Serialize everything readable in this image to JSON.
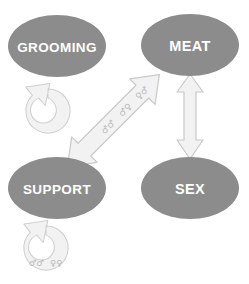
{
  "figure": {
    "background_color": "#ffffff",
    "node_fill": "#8c8c8c",
    "node_text_color": "#ffffff",
    "arrow_fill": "#f0f0f0",
    "arrow_stroke": "#c9c9c9",
    "symbol_color": "#b9b9b9"
  },
  "nodes": [
    {
      "id": "grooming",
      "label": "GROOMING",
      "cx": 57,
      "cy": 46,
      "rx": 49,
      "ry": 31
    },
    {
      "id": "meat",
      "label": "MEAT",
      "cx": 190,
      "cy": 45,
      "rx": 49,
      "ry": 31
    },
    {
      "id": "support",
      "label": "SUPPORT",
      "cx": 57,
      "cy": 188,
      "rx": 49,
      "ry": 31
    },
    {
      "id": "sex",
      "label": "SEX",
      "cx": 190,
      "cy": 188,
      "rx": 49,
      "ry": 31
    }
  ],
  "edges": [
    {
      "id": "grooming-self-loop",
      "type": "self-loop",
      "from": "grooming",
      "to": "grooming",
      "labels": []
    },
    {
      "id": "support-self-loop",
      "type": "self-loop",
      "from": "support",
      "to": "support",
      "labels": [
        "♂♂",
        "♀♀"
      ]
    },
    {
      "id": "grooming-meat-diagonal",
      "type": "double-headed-arrow",
      "from": "support",
      "to": "meat",
      "labels": [
        "♂♂",
        "♂♀",
        "♀♂"
      ]
    },
    {
      "id": "meat-sex-vertical",
      "type": "double-headed-arrow",
      "from": "meat",
      "to": "sex",
      "labels": []
    }
  ],
  "symbols": {
    "male": "♂",
    "female": "♀",
    "diagonal_pairs": [
      "♂♂",
      "♂♀",
      "♀♂"
    ],
    "support_pairs": [
      "♂♂",
      "♀♀"
    ]
  }
}
